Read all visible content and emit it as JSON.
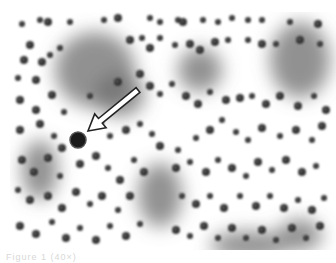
{
  "figure": {
    "type": "grayscale micrograph",
    "arrow": {
      "from": [
        138,
        90
      ],
      "to": [
        88,
        131
      ],
      "fill": "#ffffff",
      "stroke": "#222222"
    },
    "highlighted_cell": {
      "cx": 78,
      "cy": 140,
      "r": 8
    },
    "clusters": [
      {
        "cx": 95,
        "cy": 70,
        "rx": 40,
        "ry": 38
      },
      {
        "cx": 120,
        "cy": 95,
        "rx": 25,
        "ry": 22
      },
      {
        "cx": 160,
        "cy": 195,
        "rx": 22,
        "ry": 32
      },
      {
        "cx": 300,
        "cy": 60,
        "rx": 30,
        "ry": 38
      },
      {
        "cx": 250,
        "cy": 245,
        "rx": 40,
        "ry": 14
      },
      {
        "cx": 40,
        "cy": 170,
        "rx": 18,
        "ry": 30
      },
      {
        "cx": 200,
        "cy": 70,
        "rx": 22,
        "ry": 22
      },
      {
        "cx": 300,
        "cy": 235,
        "rx": 22,
        "ry": 16
      }
    ],
    "cells": [
      [
        22,
        24,
        3
      ],
      [
        40,
        20,
        3
      ],
      [
        48,
        22,
        4
      ],
      [
        70,
        22,
        3
      ],
      [
        104,
        20,
        3
      ],
      [
        118,
        18,
        4
      ],
      [
        150,
        18,
        3
      ],
      [
        160,
        22,
        3
      ],
      [
        178,
        20,
        3
      ],
      [
        183,
        22,
        4
      ],
      [
        203,
        20,
        3
      ],
      [
        218,
        22,
        3
      ],
      [
        232,
        18,
        3
      ],
      [
        248,
        20,
        3
      ],
      [
        262,
        20,
        3
      ],
      [
        290,
        22,
        3
      ],
      [
        318,
        24,
        4
      ],
      [
        30,
        45,
        4
      ],
      [
        24,
        60,
        4
      ],
      [
        42,
        62,
        4
      ],
      [
        18,
        78,
        3
      ],
      [
        36,
        80,
        4
      ],
      [
        50,
        55,
        3
      ],
      [
        60,
        48,
        3
      ],
      [
        130,
        40,
        4
      ],
      [
        142,
        38,
        3
      ],
      [
        150,
        48,
        4
      ],
      [
        160,
        38,
        3
      ],
      [
        175,
        45,
        3
      ],
      [
        190,
        44,
        4
      ],
      [
        200,
        50,
        4
      ],
      [
        215,
        42,
        4
      ],
      [
        228,
        40,
        3
      ],
      [
        248,
        40,
        3
      ],
      [
        262,
        44,
        4
      ],
      [
        276,
        44,
        3
      ],
      [
        300,
        40,
        4
      ],
      [
        320,
        44,
        3
      ],
      [
        20,
        100,
        4
      ],
      [
        36,
        110,
        4
      ],
      [
        52,
        95,
        4
      ],
      [
        64,
        112,
        3
      ],
      [
        90,
        96,
        3
      ],
      [
        118,
        82,
        4
      ],
      [
        140,
        74,
        4
      ],
      [
        150,
        86,
        4
      ],
      [
        160,
        94,
        3
      ],
      [
        172,
        84,
        3
      ],
      [
        186,
        96,
        4
      ],
      [
        198,
        104,
        4
      ],
      [
        210,
        92,
        3
      ],
      [
        226,
        100,
        4
      ],
      [
        240,
        98,
        4
      ],
      [
        252,
        96,
        3
      ],
      [
        266,
        104,
        4
      ],
      [
        280,
        96,
        4
      ],
      [
        298,
        106,
        4
      ],
      [
        314,
        96,
        3
      ],
      [
        326,
        110,
        4
      ],
      [
        20,
        130,
        4
      ],
      [
        40,
        124,
        4
      ],
      [
        54,
        136,
        3
      ],
      [
        62,
        148,
        4
      ],
      [
        100,
        122,
        4
      ],
      [
        110,
        136,
        3
      ],
      [
        126,
        130,
        4
      ],
      [
        140,
        124,
        3
      ],
      [
        152,
        134,
        3
      ],
      [
        160,
        146,
        4
      ],
      [
        178,
        150,
        3
      ],
      [
        196,
        138,
        3
      ],
      [
        210,
        130,
        4
      ],
      [
        222,
        120,
        3
      ],
      [
        236,
        132,
        3
      ],
      [
        248,
        140,
        3
      ],
      [
        262,
        128,
        4
      ],
      [
        280,
        136,
        3
      ],
      [
        296,
        130,
        4
      ],
      [
        312,
        140,
        3
      ],
      [
        322,
        126,
        4
      ],
      [
        22,
        160,
        4
      ],
      [
        34,
        172,
        4
      ],
      [
        48,
        158,
        4
      ],
      [
        60,
        176,
        3
      ],
      [
        80,
        164,
        4
      ],
      [
        96,
        156,
        4
      ],
      [
        108,
        168,
        3
      ],
      [
        120,
        180,
        4
      ],
      [
        134,
        160,
        3
      ],
      [
        144,
        172,
        4
      ],
      [
        176,
        168,
        4
      ],
      [
        190,
        162,
        3
      ],
      [
        206,
        172,
        4
      ],
      [
        218,
        160,
        3
      ],
      [
        232,
        168,
        4
      ],
      [
        246,
        176,
        3
      ],
      [
        258,
        162,
        4
      ],
      [
        272,
        170,
        3
      ],
      [
        286,
        160,
        4
      ],
      [
        302,
        172,
        4
      ],
      [
        316,
        166,
        3
      ],
      [
        18,
        190,
        3
      ],
      [
        30,
        200,
        4
      ],
      [
        48,
        196,
        4
      ],
      [
        62,
        208,
        4
      ],
      [
        76,
        192,
        4
      ],
      [
        90,
        204,
        3
      ],
      [
        102,
        196,
        4
      ],
      [
        118,
        210,
        3
      ],
      [
        130,
        196,
        4
      ],
      [
        182,
        196,
        3
      ],
      [
        196,
        204,
        4
      ],
      [
        210,
        196,
        3
      ],
      [
        224,
        208,
        4
      ],
      [
        240,
        196,
        3
      ],
      [
        256,
        206,
        4
      ],
      [
        270,
        196,
        3
      ],
      [
        284,
        208,
        4
      ],
      [
        298,
        200,
        3
      ],
      [
        312,
        210,
        4
      ],
      [
        324,
        198,
        3
      ],
      [
        20,
        226,
        4
      ],
      [
        36,
        234,
        4
      ],
      [
        52,
        222,
        3
      ],
      [
        66,
        238,
        4
      ],
      [
        80,
        228,
        3
      ],
      [
        96,
        240,
        4
      ],
      [
        110,
        226,
        3
      ],
      [
        126,
        236,
        4
      ],
      [
        140,
        224,
        3
      ],
      [
        176,
        230,
        4
      ],
      [
        190,
        236,
        3
      ],
      [
        204,
        226,
        4
      ],
      [
        218,
        238,
        3
      ],
      [
        232,
        228,
        4
      ],
      [
        246,
        238,
        3
      ],
      [
        262,
        230,
        4
      ],
      [
        276,
        240,
        3
      ],
      [
        292,
        228,
        4
      ],
      [
        306,
        238,
        3
      ],
      [
        320,
        226,
        4
      ]
    ]
  },
  "caption": {
    "text": "Figure 1 (40×)"
  }
}
